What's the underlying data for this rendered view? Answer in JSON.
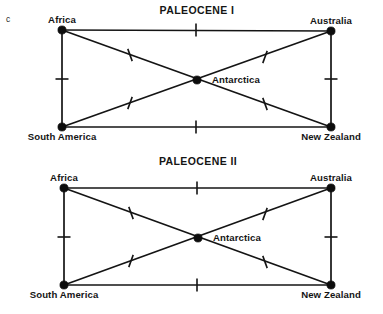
{
  "figure": {
    "letter": "c",
    "background_color": "#ffffff",
    "ink_color": "#141414"
  },
  "chart_data": {
    "type": "diagram",
    "title": "",
    "subtype": "area-cladogram-network",
    "panels": [
      {
        "id": "paleocene-1",
        "title": "PALEOCENE I",
        "title_x": 197,
        "title_y": 11,
        "nodes": [
          {
            "id": "africa",
            "label": "Africa",
            "x": 62,
            "y": 30,
            "label_x": 62,
            "label_y": 20,
            "label_anchor": "middle",
            "label_pos": "above"
          },
          {
            "id": "australia",
            "label": "Australia",
            "x": 331,
            "y": 31,
            "label_x": 331,
            "label_y": 21,
            "label_anchor": "middle",
            "label_pos": "above"
          },
          {
            "id": "south-america",
            "label": "South America",
            "x": 62,
            "y": 127,
            "label_x": 62,
            "label_y": 137,
            "label_anchor": "middle",
            "label_pos": "below"
          },
          {
            "id": "new-zealand",
            "label": "New Zealand",
            "x": 331,
            "y": 127,
            "label_x": 331,
            "label_y": 137,
            "label_anchor": "middle",
            "label_pos": "below"
          },
          {
            "id": "antarctica",
            "label": "Antarctica",
            "x": 197,
            "y": 80,
            "label_x": 212,
            "label_y": 80,
            "label_anchor": "start",
            "label_pos": "right"
          }
        ],
        "edges": [
          {
            "from": "africa",
            "to": "australia",
            "kind": "top"
          },
          {
            "from": "south-america",
            "to": "new-zealand",
            "kind": "bottom"
          },
          {
            "from": "africa",
            "to": "south-america",
            "kind": "left"
          },
          {
            "from": "australia",
            "to": "new-zealand",
            "kind": "right"
          },
          {
            "from": "africa",
            "to": "new-zealand",
            "kind": "diagonal"
          },
          {
            "from": "south-america",
            "to": "australia",
            "kind": "diagonal"
          }
        ],
        "ticks": [
          {
            "id": "tick-top",
            "x": 196,
            "y": 30,
            "angle": 90,
            "length": 13
          },
          {
            "id": "tick-bottom",
            "x": 196,
            "y": 127,
            "angle": 90,
            "length": 13
          },
          {
            "id": "tick-left",
            "x": 62,
            "y": 79,
            "angle": 0,
            "length": 13
          },
          {
            "id": "tick-right",
            "x": 331,
            "y": 79,
            "angle": 0,
            "length": 13
          },
          {
            "id": "tick-diag-upleft",
            "x": 130,
            "y": 55,
            "angle": 70,
            "length": 13
          },
          {
            "id": "tick-diag-upright",
            "x": 265,
            "y": 57,
            "angle": 110,
            "length": 13
          },
          {
            "id": "tick-diag-lowleft",
            "x": 130,
            "y": 103,
            "angle": 110,
            "length": 13
          },
          {
            "id": "tick-diag-lowright",
            "x": 265,
            "y": 104,
            "angle": 70,
            "length": 13
          }
        ]
      },
      {
        "id": "paleocene-2",
        "title": "PALEOCENE II",
        "title_x": 198,
        "title_y": 162,
        "nodes": [
          {
            "id": "africa",
            "label": "Africa",
            "x": 64,
            "y": 188,
            "label_x": 64,
            "label_y": 178,
            "label_anchor": "middle",
            "label_pos": "above"
          },
          {
            "id": "australia",
            "label": "Australia",
            "x": 331,
            "y": 188,
            "label_x": 331,
            "label_y": 178,
            "label_anchor": "middle",
            "label_pos": "above"
          },
          {
            "id": "south-america",
            "label": "South America",
            "x": 64,
            "y": 285,
            "label_x": 64,
            "label_y": 295,
            "label_anchor": "middle",
            "label_pos": "below"
          },
          {
            "id": "new-zealand",
            "label": "New Zealand",
            "x": 331,
            "y": 285,
            "label_x": 331,
            "label_y": 295,
            "label_anchor": "middle",
            "label_pos": "below"
          },
          {
            "id": "antarctica",
            "label": "Antarctica",
            "x": 198,
            "y": 238,
            "label_x": 213,
            "label_y": 238,
            "label_anchor": "start",
            "label_pos": "right"
          }
        ],
        "edges": [
          {
            "from": "africa",
            "to": "australia",
            "kind": "top"
          },
          {
            "from": "south-america",
            "to": "new-zealand",
            "kind": "bottom"
          },
          {
            "from": "africa",
            "to": "south-america",
            "kind": "left"
          },
          {
            "from": "australia",
            "to": "new-zealand",
            "kind": "right"
          },
          {
            "from": "africa",
            "to": "new-zealand",
            "kind": "diagonal"
          },
          {
            "from": "south-america",
            "to": "australia",
            "kind": "diagonal"
          }
        ],
        "ticks": [
          {
            "id": "tick-top",
            "x": 197,
            "y": 188,
            "angle": 90,
            "length": 13
          },
          {
            "id": "tick-bottom",
            "x": 197,
            "y": 285,
            "angle": 90,
            "length": 13
          },
          {
            "id": "tick-left",
            "x": 64,
            "y": 237,
            "angle": 0,
            "length": 13
          },
          {
            "id": "tick-right",
            "x": 331,
            "y": 237,
            "angle": 0,
            "length": 13
          },
          {
            "id": "tick-diag-upleft",
            "x": 131,
            "y": 213,
            "angle": 70,
            "length": 13
          },
          {
            "id": "tick-diag-upright",
            "x": 265,
            "y": 214,
            "angle": 110,
            "length": 13
          },
          {
            "id": "tick-diag-lowleft",
            "x": 131,
            "y": 261,
            "angle": 110,
            "length": 13
          },
          {
            "id": "tick-diag-lowright",
            "x": 265,
            "y": 262,
            "angle": 70,
            "length": 13
          }
        ]
      }
    ]
  }
}
